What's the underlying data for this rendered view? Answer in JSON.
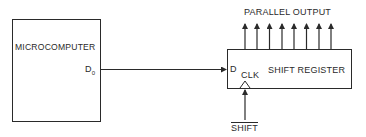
{
  "diagram": {
    "microcomputer": {
      "label": "MICROCOMPUTER",
      "pin": "D",
      "pin_subscript": "0"
    },
    "shift_register": {
      "label": "SHIFT REGISTER",
      "data_input": "D",
      "clock_input": "CLK"
    },
    "outputs_label": "PARALLEL OUTPUT",
    "output_count": 8,
    "shift_signal": "SHIFT",
    "colors": {
      "stroke": "#2a2a2a",
      "background": "#ffffff"
    }
  }
}
